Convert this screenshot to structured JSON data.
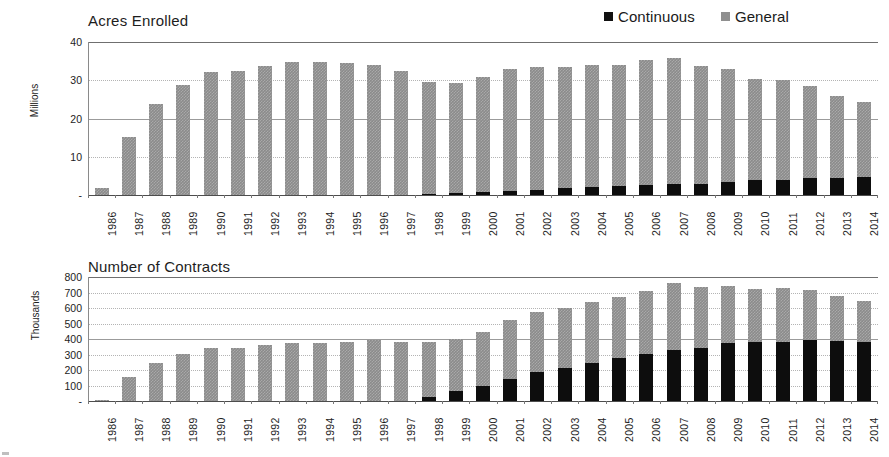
{
  "legend": {
    "items": [
      {
        "label": "Continuous",
        "color": "#111111",
        "name": "legend-continuous"
      },
      {
        "label": "General",
        "color": "#8f8f8f",
        "name": "legend-general"
      }
    ]
  },
  "charts": [
    {
      "id": "acres-enrolled",
      "title": "Acres Enrolled",
      "unit_label": "Millions",
      "yticks": [
        "40",
        "30",
        "20",
        "10",
        "-"
      ]
    },
    {
      "id": "number-of-contracts",
      "title": "Number of Contracts",
      "unit_label": "Thousands",
      "yticks": [
        "800",
        "700",
        "600",
        "500",
        "400",
        "300",
        "200",
        "100",
        "-"
      ]
    }
  ],
  "chart_data": [
    {
      "type": "bar",
      "stacked": true,
      "title": "Acres Enrolled",
      "xlabel": "",
      "ylabel": "Millions",
      "ylim": [
        0,
        40
      ],
      "yticks": [
        0,
        10,
        20,
        30,
        40
      ],
      "ytick_labels": [
        "-",
        "10",
        "20",
        "30",
        "40"
      ],
      "grid": true,
      "legend_position": "top-right",
      "categories": [
        "1986",
        "1987",
        "1988",
        "1989",
        "1990",
        "1991",
        "1992",
        "1993",
        "1994",
        "1995",
        "1996",
        "1997",
        "1998",
        "1999",
        "2000",
        "2001",
        "2002",
        "2003",
        "2004",
        "2005",
        "2006",
        "2007",
        "2008",
        "2009",
        "2010",
        "2011",
        "2012",
        "2013",
        "2014"
      ],
      "series": [
        {
          "name": "Continuous",
          "color": "#111111",
          "values": [
            0,
            0,
            0,
            0,
            0,
            0,
            0,
            0,
            0,
            0,
            0,
            0,
            0.2,
            0.5,
            0.7,
            1.1,
            1.4,
            1.8,
            2.0,
            2.3,
            2.5,
            2.9,
            3.0,
            3.5,
            3.9,
            4.0,
            4.4,
            4.5,
            4.8
          ]
        },
        {
          "name": "General",
          "color": "#8f8f8f",
          "values": [
            1.9,
            15.2,
            23.8,
            28.7,
            32.2,
            32.5,
            33.8,
            34.7,
            34.7,
            34.6,
            34.0,
            32.4,
            29.4,
            28.8,
            30.2,
            31.8,
            32.0,
            31.6,
            31.9,
            31.7,
            32.7,
            33.0,
            30.8,
            29.4,
            26.5,
            26.1,
            24.1,
            21.3,
            19.6
          ]
        }
      ],
      "totals": [
        1.9,
        15.2,
        23.8,
        28.7,
        32.2,
        32.5,
        33.8,
        34.7,
        34.7,
        34.6,
        34.0,
        32.4,
        29.6,
        29.3,
        30.9,
        32.9,
        33.4,
        33.4,
        33.9,
        34.0,
        35.2,
        35.9,
        33.8,
        32.9,
        30.4,
        30.1,
        28.5,
        25.8,
        24.4
      ]
    },
    {
      "type": "bar",
      "stacked": true,
      "title": "Number of Contracts",
      "xlabel": "",
      "ylabel": "Thousands",
      "ylim": [
        0,
        800
      ],
      "yticks": [
        0,
        100,
        200,
        300,
        400,
        500,
        600,
        700,
        800
      ],
      "ytick_labels": [
        "-",
        "100",
        "200",
        "300",
        "400",
        "500",
        "600",
        "700",
        "800"
      ],
      "grid": true,
      "legend_position": "top-right",
      "categories": [
        "1986",
        "1987",
        "1988",
        "1989",
        "1990",
        "1991",
        "1992",
        "1993",
        "1994",
        "1995",
        "1996",
        "1997",
        "1998",
        "1999",
        "2000",
        "2001",
        "2002",
        "2003",
        "2004",
        "2005",
        "2006",
        "2007",
        "2008",
        "2009",
        "2010",
        "2011",
        "2012",
        "2013",
        "2014"
      ],
      "series": [
        {
          "name": "Continuous",
          "color": "#111111",
          "values": [
            0,
            0,
            0,
            0,
            0,
            0,
            0,
            0,
            0,
            0,
            0,
            0,
            28,
            62,
            100,
            140,
            185,
            215,
            245,
            278,
            303,
            330,
            345,
            372,
            378,
            378,
            392,
            385,
            380
          ]
        },
        {
          "name": "General",
          "color": "#8f8f8f",
          "values": [
            8,
            155,
            245,
            305,
            340,
            342,
            362,
            377,
            377,
            382,
            392,
            382,
            355,
            335,
            345,
            385,
            387,
            385,
            395,
            392,
            410,
            430,
            388,
            370,
            345,
            352,
            322,
            293,
            266
          ]
        }
      ],
      "totals": [
        8,
        155,
        245,
        305,
        340,
        342,
        362,
        377,
        377,
        382,
        392,
        382,
        383,
        397,
        445,
        525,
        572,
        600,
        640,
        670,
        713,
        760,
        733,
        742,
        723,
        730,
        714,
        678,
        646
      ]
    }
  ]
}
